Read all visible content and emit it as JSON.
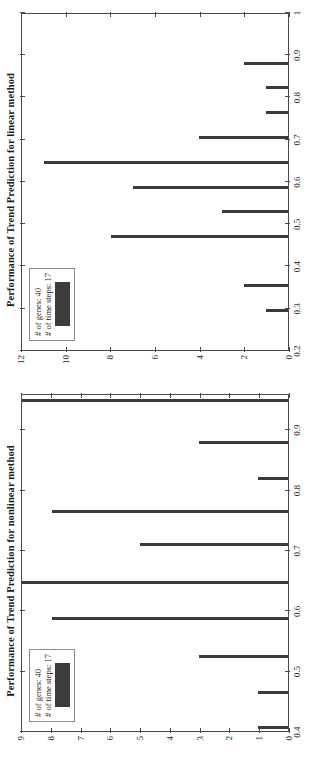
{
  "figure": {
    "orientation": "rotated-90-ccw",
    "bar_color": "#3b3b3b",
    "axis_color": "#4a4a4a",
    "background": "#ffffff"
  },
  "charts": [
    {
      "id": "linear",
      "title": "Performance of Trend Prediction for linear method",
      "legend": {
        "line1": "# of genes: 40",
        "line2": "# of time steps: 17",
        "swatch_color": "#3b3b3b"
      },
      "xlabel": "",
      "ylabel": "",
      "xticks": [
        "0.2",
        "0.3",
        "0.4",
        "0.5",
        "0.6",
        "0.7",
        "0.8",
        "0.9",
        "1"
      ],
      "xtick_values": [
        0.2,
        0.3,
        0.4,
        0.5,
        0.6,
        0.7,
        0.8,
        0.9,
        1.0
      ],
      "yticks": [
        "0",
        "2",
        "4",
        "6",
        "8",
        "10",
        "12"
      ],
      "ytick_values": [
        0,
        2,
        4,
        6,
        8,
        10,
        12
      ],
      "xlim": [
        0.2,
        1.0
      ],
      "ylim": [
        0,
        12
      ],
      "bars": [
        {
          "x": 0.294,
          "height": 1
        },
        {
          "x": 0.353,
          "height": 2
        },
        {
          "x": 0.47,
          "height": 8
        },
        {
          "x": 0.529,
          "height": 3
        },
        {
          "x": 0.588,
          "height": 7
        },
        {
          "x": 0.647,
          "height": 11
        },
        {
          "x": 0.706,
          "height": 4
        },
        {
          "x": 0.765,
          "height": 1
        },
        {
          "x": 0.824,
          "height": 1
        },
        {
          "x": 0.882,
          "height": 2
        }
      ]
    },
    {
      "id": "nonlinear",
      "title": "Performance of Trend Prediction for nonlinear method",
      "legend": {
        "line1": "# of genes: 40",
        "line2": "# of time steps: 17",
        "swatch_color": "#3b3b3b"
      },
      "xlabel": "",
      "ylabel": "",
      "xticks": [
        "0.4",
        "0.5",
        "0.6",
        "0.7",
        "0.8",
        "0.9"
      ],
      "xtick_values": [
        0.4,
        0.5,
        0.6,
        0.7,
        0.8,
        0.9
      ],
      "yticks": [
        "0",
        "1",
        "2",
        "3",
        "4",
        "5",
        "6",
        "7",
        "8",
        "9"
      ],
      "ytick_values": [
        0,
        1,
        2,
        3,
        4,
        5,
        6,
        7,
        8,
        9
      ],
      "xlim": [
        0.4,
        0.96
      ],
      "ylim": [
        0,
        9
      ],
      "bars": [
        {
          "x": 0.406,
          "height": 1
        },
        {
          "x": 0.465,
          "height": 1
        },
        {
          "x": 0.524,
          "height": 3
        },
        {
          "x": 0.588,
          "height": 8
        },
        {
          "x": 0.647,
          "height": 9
        },
        {
          "x": 0.71,
          "height": 5
        },
        {
          "x": 0.765,
          "height": 8
        },
        {
          "x": 0.82,
          "height": 1
        },
        {
          "x": 0.88,
          "height": 3
        },
        {
          "x": 0.95,
          "height": 9
        }
      ]
    }
  ],
  "chart_data": [
    {
      "type": "bar",
      "title": "Performance of Trend Prediction for linear method",
      "xlabel": "",
      "ylabel": "",
      "xlim": [
        0.2,
        1.0
      ],
      "ylim": [
        0,
        12
      ],
      "grid": false,
      "legend_position": "top-left",
      "legend": [
        "# of genes: 40",
        "# of time steps: 17"
      ],
      "categories": [
        0.294,
        0.353,
        0.47,
        0.529,
        0.588,
        0.647,
        0.706,
        0.765,
        0.824,
        0.882
      ],
      "values": [
        1,
        2,
        8,
        3,
        7,
        11,
        4,
        1,
        1,
        2
      ],
      "xtick_labels": [
        "0.2",
        "0.3",
        "0.4",
        "0.5",
        "0.6",
        "0.7",
        "0.8",
        "0.9",
        "1"
      ],
      "ytick_labels": [
        "0",
        "2",
        "4",
        "6",
        "8",
        "10",
        "12"
      ]
    },
    {
      "type": "bar",
      "title": "Performance of Trend Prediction for nonlinear method",
      "xlabel": "",
      "ylabel": "",
      "xlim": [
        0.4,
        0.96
      ],
      "ylim": [
        0,
        9
      ],
      "grid": false,
      "legend_position": "top-left",
      "legend": [
        "# of genes: 40",
        "# of time steps: 17"
      ],
      "categories": [
        0.406,
        0.465,
        0.524,
        0.588,
        0.647,
        0.71,
        0.765,
        0.82,
        0.88,
        0.95
      ],
      "values": [
        1,
        1,
        3,
        8,
        9,
        5,
        8,
        1,
        3,
        9
      ],
      "xtick_labels": [
        "0.4",
        "0.5",
        "0.6",
        "0.7",
        "0.8",
        "0.9"
      ],
      "ytick_labels": [
        "0",
        "1",
        "2",
        "3",
        "4",
        "5",
        "6",
        "7",
        "8",
        "9"
      ]
    }
  ]
}
